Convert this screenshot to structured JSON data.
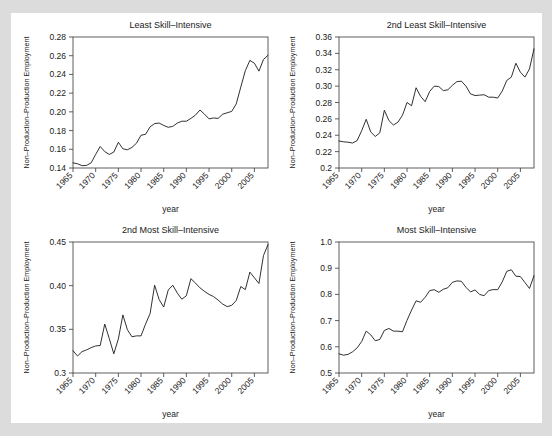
{
  "figure": {
    "background_color": "#dcdcdc",
    "panel_color": "#ffffff",
    "line_color": "#1a1a1a",
    "axis_color": "#4d4d4d"
  },
  "chart_data": [
    {
      "type": "line",
      "title": "Least Skill–Intensive",
      "xlabel": "year",
      "ylabel": "Non–Production–Production Employment",
      "xlim": [
        1965,
        2008
      ],
      "ylim": [
        0.14,
        0.28
      ],
      "xticks": [
        1965,
        1970,
        1975,
        1980,
        1985,
        1990,
        1995,
        2000,
        2005
      ],
      "yticks": [
        0.14,
        0.16,
        0.18,
        0.2,
        0.22,
        0.24,
        0.26,
        0.28
      ],
      "ytick_labels": [
        "0.14",
        "0.16",
        "0.18",
        "0.20",
        "0.22",
        "0.24",
        "0.26",
        "0.28"
      ],
      "grid": false,
      "legend": "none",
      "x": [
        1965,
        1966,
        1967,
        1968,
        1969,
        1970,
        1971,
        1972,
        1973,
        1974,
        1975,
        1976,
        1977,
        1978,
        1979,
        1980,
        1981,
        1982,
        1983,
        1984,
        1985,
        1986,
        1987,
        1988,
        1989,
        1990,
        1991,
        1992,
        1993,
        1994,
        1995,
        1996,
        1997,
        1998,
        1999,
        2000,
        2001,
        2002,
        2003,
        2004,
        2005,
        2006,
        2007,
        2008
      ],
      "values": [
        0.1455,
        0.1445,
        0.1425,
        0.1428,
        0.1455,
        0.1545,
        0.163,
        0.1575,
        0.1545,
        0.157,
        0.1675,
        0.1605,
        0.1595,
        0.162,
        0.1665,
        0.175,
        0.176,
        0.184,
        0.1875,
        0.188,
        0.1855,
        0.1835,
        0.1845,
        0.188,
        0.19,
        0.19,
        0.193,
        0.1965,
        0.202,
        0.1975,
        0.1925,
        0.1935,
        0.193,
        0.1975,
        0.199,
        0.2005,
        0.2085,
        0.2265,
        0.244,
        0.255,
        0.252,
        0.2435,
        0.256,
        0.2605
      ]
    },
    {
      "type": "line",
      "title": "2nd Least Skill–Intensive",
      "xlabel": "year",
      "ylabel": "Non–Production–Production Employment",
      "xlim": [
        1965,
        2008
      ],
      "ylim": [
        0.2,
        0.36
      ],
      "xticks": [
        1965,
        1970,
        1975,
        1980,
        1985,
        1990,
        1995,
        2000,
        2005
      ],
      "yticks": [
        0.2,
        0.22,
        0.24,
        0.26,
        0.28,
        0.3,
        0.32,
        0.34,
        0.36
      ],
      "ytick_labels": [
        "0.2",
        "0.22",
        "0.24",
        "0.26",
        "0.28",
        "0.30",
        "0.32",
        "0.34",
        "0.36"
      ],
      "grid": false,
      "legend": "none",
      "x": [
        1965,
        1966,
        1967,
        1968,
        1969,
        1970,
        1971,
        1972,
        1973,
        1974,
        1975,
        1976,
        1977,
        1978,
        1979,
        1980,
        1981,
        1982,
        1983,
        1984,
        1985,
        1986,
        1987,
        1988,
        1989,
        1990,
        1991,
        1992,
        1993,
        1994,
        1995,
        1996,
        1997,
        1998,
        1999,
        2000,
        2001,
        2002,
        2003,
        2004,
        2005,
        2006,
        2007,
        2008
      ],
      "values": [
        0.233,
        0.232,
        0.2315,
        0.2305,
        0.2335,
        0.2455,
        0.2595,
        0.244,
        0.2385,
        0.243,
        0.2705,
        0.258,
        0.2525,
        0.256,
        0.2645,
        0.28,
        0.276,
        0.298,
        0.2875,
        0.281,
        0.2935,
        0.3,
        0.2995,
        0.2945,
        0.2955,
        0.301,
        0.3055,
        0.306,
        0.3,
        0.2905,
        0.2885,
        0.289,
        0.2895,
        0.2865,
        0.2865,
        0.2855,
        0.294,
        0.307,
        0.311,
        0.328,
        0.317,
        0.311,
        0.321,
        0.3455
      ]
    },
    {
      "type": "line",
      "title": "2nd Most Skill–Intensive",
      "xlabel": "year",
      "ylabel": "Non–Production–Production Employment",
      "xlim": [
        1965,
        2008
      ],
      "ylim": [
        0.3,
        0.45
      ],
      "xticks": [
        1965,
        1970,
        1975,
        1980,
        1985,
        1990,
        1995,
        2000,
        2005
      ],
      "yticks": [
        0.3,
        0.35,
        0.4,
        0.45
      ],
      "ytick_labels": [
        "0.3",
        "0.35",
        "0.40",
        "0.45"
      ],
      "grid": false,
      "legend": "none",
      "x": [
        1965,
        1966,
        1967,
        1968,
        1969,
        1970,
        1971,
        1972,
        1973,
        1974,
        1975,
        1976,
        1977,
        1978,
        1979,
        1980,
        1981,
        1982,
        1983,
        1984,
        1985,
        1986,
        1987,
        1988,
        1989,
        1990,
        1991,
        1992,
        1993,
        1994,
        1995,
        1996,
        1997,
        1998,
        1999,
        2000,
        2001,
        2002,
        2003,
        2004,
        2005,
        2006,
        2007,
        2008
      ],
      "values": [
        0.3255,
        0.3195,
        0.3245,
        0.3265,
        0.329,
        0.331,
        0.3315,
        0.356,
        0.3395,
        0.322,
        0.339,
        0.3665,
        0.3495,
        0.3415,
        0.3425,
        0.3425,
        0.356,
        0.368,
        0.4005,
        0.384,
        0.3755,
        0.395,
        0.4005,
        0.3915,
        0.3845,
        0.3885,
        0.408,
        0.403,
        0.3975,
        0.3935,
        0.39,
        0.3875,
        0.3835,
        0.379,
        0.376,
        0.3775,
        0.383,
        0.399,
        0.3955,
        0.4155,
        0.409,
        0.4025,
        0.4345,
        0.447
      ]
    },
    {
      "type": "line",
      "title": "Most Skill–Intensive",
      "xlabel": "year",
      "ylabel": "Non–Production–Production Employment",
      "xlim": [
        1965,
        2008
      ],
      "ylim": [
        0.5,
        1.0
      ],
      "xticks": [
        1965,
        1970,
        1975,
        1980,
        1985,
        1990,
        1995,
        2000,
        2005
      ],
      "yticks": [
        0.5,
        0.6,
        0.7,
        0.8,
        0.9,
        1.0
      ],
      "ytick_labels": [
        "0.5",
        "0.6",
        "0.7",
        "0.8",
        "0.9",
        "1.0"
      ],
      "grid": false,
      "legend": "none",
      "x": [
        1965,
        1966,
        1967,
        1968,
        1969,
        1970,
        1971,
        1972,
        1973,
        1974,
        1975,
        1976,
        1977,
        1978,
        1979,
        1980,
        1981,
        1982,
        1983,
        1984,
        1985,
        1986,
        1987,
        1988,
        1989,
        1990,
        1991,
        1992,
        1993,
        1994,
        1995,
        1996,
        1997,
        1998,
        1999,
        2000,
        2001,
        2002,
        2003,
        2004,
        2005,
        2006,
        2007,
        2008
      ],
      "values": [
        0.573,
        0.568,
        0.571,
        0.581,
        0.596,
        0.62,
        0.66,
        0.6455,
        0.623,
        0.628,
        0.6625,
        0.67,
        0.66,
        0.6595,
        0.6575,
        0.701,
        0.74,
        0.7755,
        0.77,
        0.789,
        0.8145,
        0.818,
        0.808,
        0.8195,
        0.8255,
        0.846,
        0.8515,
        0.85,
        0.827,
        0.8095,
        0.817,
        0.8,
        0.795,
        0.8145,
        0.8185,
        0.818,
        0.848,
        0.888,
        0.894,
        0.8695,
        0.868,
        0.8455,
        0.8225,
        0.8715
      ]
    }
  ]
}
